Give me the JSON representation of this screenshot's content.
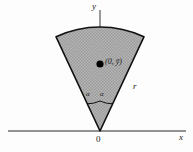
{
  "figure": {
    "type": "geometry-diagram",
    "colors": {
      "background": "#fdfdfd",
      "sector_fill": "#a9a9a9",
      "sector_stroke": "#111111",
      "axis": "#6e6e6e",
      "label": "#1a1a1a",
      "point": "#000000"
    }
  },
  "axes": {
    "y_label": "y",
    "x_label": "x",
    "origin_label": "0"
  },
  "annotations": {
    "centroid_label": "(0, ȳ)",
    "radius_label": "r",
    "angle_left_label": "α",
    "angle_right_label": "α"
  },
  "geometry": {
    "apex": {
      "x": 100,
      "y": 131
    },
    "centroid_point": {
      "x": 100,
      "y": 64
    },
    "radius_px": 104,
    "half_angle_deg": 25,
    "arc_left_end": {
      "x": 55,
      "y": 30
    },
    "arc_right_end": {
      "x": 145,
      "y": 30
    },
    "y_axis": {
      "x": 100,
      "y_top": 10,
      "y_bottom": 131
    },
    "x_axis": {
      "y": 131,
      "x_left": 8,
      "x_right": 186
    },
    "angle_arc_radius_px": 30
  }
}
